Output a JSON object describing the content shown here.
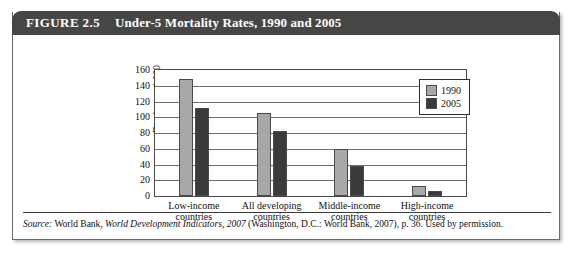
{
  "figure": {
    "number": "FIGURE 2.5",
    "title": "Under-5 Mortality Rates, 1990 and 2005",
    "source_prefix": "Source:",
    "source_part1": " World Bank, ",
    "source_italic": "World Development Indicators, 2007",
    "source_part2": " (Washington, D.C.: World Bank, 2007), p. 36. Used by permission."
  },
  "colors": {
    "header_bg": "#464646",
    "series_1990": "#a8a8a8",
    "series_2005": "#3a3a3a",
    "axis": "#4a4a4a",
    "gridline": "#6f6f6f"
  },
  "chart_data": {
    "type": "bar",
    "title": "Under-5 Mortality Rates, 1990 and 2005",
    "xlabel": "",
    "ylabel": "Deaths per 1,000\nlive births",
    "ylim": [
      0,
      160
    ],
    "yticks": [
      0,
      20,
      40,
      60,
      80,
      100,
      120,
      140,
      160
    ],
    "ytick_labels": [
      "0",
      "20",
      "40",
      "60",
      "80",
      "100",
      "120",
      "140",
      "160"
    ],
    "grid": true,
    "legend_position": "top-right",
    "categories": [
      "Low-income\ncountries",
      "All developing\ncountries",
      "Middle-income\ncountries",
      "High-income\ncountries"
    ],
    "series": [
      {
        "name": "1990",
        "color": "#a8a8a8",
        "values": [
          148,
          105,
          60,
          13
        ]
      },
      {
        "name": "2005",
        "color": "#3a3a3a",
        "values": [
          112,
          83,
          38,
          7
        ]
      }
    ]
  }
}
